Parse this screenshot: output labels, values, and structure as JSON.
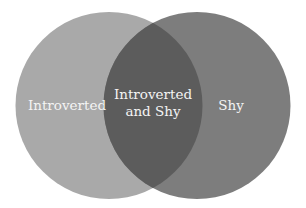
{
  "diagram": {
    "type": "venn",
    "colors": {
      "background": "#ffffff",
      "left_circle": "#a9a9a9",
      "right_circle": "#7d7d7d",
      "overlap": "#5c5c5c",
      "text": "#f4f4f4"
    },
    "sets": [
      {
        "id": "introverted",
        "label": "Introverted"
      },
      {
        "id": "shy",
        "label": "Shy"
      }
    ],
    "overlap": {
      "label_line1": "Introverted",
      "label_line2": "and Shy"
    }
  }
}
